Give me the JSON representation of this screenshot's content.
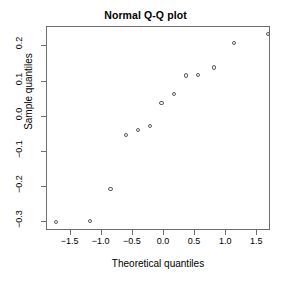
{
  "chart_data": {
    "type": "scatter",
    "title": "Normal Q-Q plot",
    "xlabel": "Theoretical quantiles",
    "ylabel": "Sample quantiles",
    "xlim": [
      -1.88,
      1.72
    ],
    "ylim": [
      -0.325,
      0.255
    ],
    "grid": false,
    "legend": null,
    "xticks": [
      -1.5,
      -1.0,
      -0.5,
      0.0,
      0.5,
      1.0,
      1.5
    ],
    "xticklabels": [
      "-1.5",
      "-1.0",
      "-0.5",
      "0.0",
      "0.5",
      "1.0",
      "1.5"
    ],
    "yticks": [
      0.2,
      0.1,
      0.0,
      -0.1,
      -0.2,
      -0.3
    ],
    "yticklabels": [
      "0.2",
      "0.1",
      "0.0",
      "-0.1",
      "-0.2",
      "-0.3"
    ],
    "marker": "open-circle",
    "marker_color": "#5a5a5a",
    "points": [
      {
        "x": -1.73,
        "y": -0.3
      },
      {
        "x": -1.19,
        "y": -0.296
      },
      {
        "x": -0.86,
        "y": -0.206
      },
      {
        "x": -0.61,
        "y": -0.051
      },
      {
        "x": -0.42,
        "y": -0.037
      },
      {
        "x": -0.22,
        "y": -0.026
      },
      {
        "x": -0.04,
        "y": 0.04
      },
      {
        "x": 0.16,
        "y": 0.065
      },
      {
        "x": 0.36,
        "y": 0.117
      },
      {
        "x": 0.55,
        "y": 0.119
      },
      {
        "x": 0.81,
        "y": 0.14
      },
      {
        "x": 1.12,
        "y": 0.21
      },
      {
        "x": 1.67,
        "y": 0.236
      }
    ]
  }
}
